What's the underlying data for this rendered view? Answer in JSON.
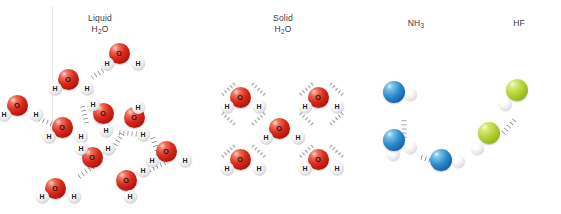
{
  "figure": {
    "title_visible": false,
    "background": "#ffffff",
    "width": 561,
    "height": 214,
    "divider": {
      "x": 52,
      "y": 6,
      "height": 132,
      "color": "#e9e6ea"
    }
  },
  "palette": {
    "oxygen": "#d92b1b",
    "hydrogen": "#f2f1f3",
    "nitrogen": "#2d8ccd",
    "fluorine": "#b5d334",
    "hydrogen_bond": "#8c8c8c",
    "label_text": "#3b3b3b",
    "atom_text": "#231f20"
  },
  "panels": [
    {
      "id": "liquid-water",
      "caption_line1": "Liquid",
      "caption_formula_base": "H",
      "caption_formula_sub": "2",
      "caption_formula_tail": "O",
      "caption_x": 100,
      "caption_y": 13,
      "molecule_label_o": "O",
      "molecule_label_h": "H",
      "molecules": [
        {
          "x": 17,
          "y": 105,
          "h1": {
            "dx": -13,
            "dy": 9,
            "label": "H"
          },
          "h2": {
            "dx": 19,
            "dy": 9,
            "label": "H"
          }
        },
        {
          "x": 62,
          "y": 127,
          "h1": {
            "dx": -13,
            "dy": 9,
            "label": "H"
          },
          "h2": {
            "dx": 19,
            "dy": 9,
            "label": "H"
          }
        },
        {
          "x": 68,
          "y": 79,
          "h1": {
            "dx": -13,
            "dy": 9,
            "label": "H"
          },
          "h2": {
            "dx": 19,
            "dy": 9,
            "label": "H"
          }
        },
        {
          "x": 119,
          "y": 53,
          "h1": {
            "dx": -12,
            "dy": 10,
            "label": "H"
          },
          "h2": {
            "dx": 19,
            "dy": 10,
            "label": "H"
          }
        },
        {
          "x": 103,
          "y": 113,
          "h1": {
            "dx": -10,
            "dy": -9,
            "label": "H"
          },
          "h2": {
            "dx": 3,
            "dy": 17,
            "label": "H"
          }
        },
        {
          "x": 134,
          "y": 117,
          "h1": {
            "dx": 4,
            "dy": -10,
            "label": "H"
          },
          "h2": {
            "dx": 9,
            "dy": 17,
            "label": "H"
          }
        },
        {
          "x": 92,
          "y": 157,
          "h1": {
            "dx": -11,
            "dy": -9,
            "label": "H"
          },
          "h2": {
            "dx": 16,
            "dy": -9,
            "label": "H"
          }
        },
        {
          "x": 55,
          "y": 188,
          "h1": {
            "dx": -13,
            "dy": 8,
            "label": "H"
          },
          "h2": {
            "dx": 19,
            "dy": 8,
            "label": "H"
          }
        },
        {
          "x": 126,
          "y": 180,
          "h1": {
            "dx": 17,
            "dy": -10,
            "label": "H"
          },
          "h2": {
            "dx": 4,
            "dy": 16,
            "label": "H"
          }
        },
        {
          "x": 166,
          "y": 151,
          "h1": {
            "dx": -14,
            "dy": 9,
            "label": "H"
          },
          "h2": {
            "dx": 19,
            "dy": 9,
            "label": "H"
          }
        }
      ],
      "bonds": [
        {
          "x": 38,
          "y": 118,
          "len": 20,
          "rot": 22
        },
        {
          "x": 82,
          "y": 104,
          "len": 21,
          "rot": 76
        },
        {
          "x": 92,
          "y": 77,
          "len": 25,
          "rot": -33
        },
        {
          "x": 118,
          "y": 132,
          "len": 20,
          "rot": 5
        },
        {
          "x": 112,
          "y": 150,
          "len": 22,
          "rot": -58
        },
        {
          "x": 78,
          "y": 177,
          "len": 20,
          "rot": -36
        },
        {
          "x": 152,
          "y": 136,
          "len": 20,
          "rot": 70
        },
        {
          "x": 148,
          "y": 170,
          "len": 20,
          "rot": -24
        }
      ]
    },
    {
      "id": "solid-water",
      "caption_line1": "Solid",
      "caption_formula_base": "H",
      "caption_formula_sub": "2",
      "caption_formula_tail": "O",
      "caption_x": 283,
      "caption_y": 13,
      "molecule_label_o": "O",
      "molecule_label_h": "H",
      "molecules": [
        {
          "x": 240,
          "y": 97,
          "h1": {
            "dx": -13,
            "dy": 9,
            "label": "H"
          },
          "h2": {
            "dx": 19,
            "dy": 9,
            "label": "H"
          }
        },
        {
          "x": 318,
          "y": 97,
          "h1": {
            "dx": -13,
            "dy": 9,
            "label": "H"
          },
          "h2": {
            "dx": 19,
            "dy": 9,
            "label": "H"
          }
        },
        {
          "x": 279,
          "y": 128,
          "h1": {
            "dx": -13,
            "dy": 9,
            "label": "H"
          },
          "h2": {
            "dx": 19,
            "dy": 9,
            "label": "H"
          }
        },
        {
          "x": 240,
          "y": 159,
          "h1": {
            "dx": -13,
            "dy": 9,
            "label": "H"
          },
          "h2": {
            "dx": 19,
            "dy": 9,
            "label": "H"
          }
        },
        {
          "x": 318,
          "y": 159,
          "h1": {
            "dx": -13,
            "dy": 9,
            "label": "H"
          },
          "h2": {
            "dx": 19,
            "dy": 9,
            "label": "H"
          }
        }
      ],
      "bonds": [
        {
          "x": 222,
          "y": 95,
          "len": 18,
          "rot": -42
        },
        {
          "x": 265,
          "y": 95,
          "len": 18,
          "rot": -138
        },
        {
          "x": 222,
          "y": 113,
          "len": 18,
          "rot": 42
        },
        {
          "x": 265,
          "y": 113,
          "len": 18,
          "rot": 138
        },
        {
          "x": 300,
          "y": 95,
          "len": 18,
          "rot": -42
        },
        {
          "x": 343,
          "y": 95,
          "len": 18,
          "rot": -138
        },
        {
          "x": 300,
          "y": 113,
          "len": 18,
          "rot": 42
        },
        {
          "x": 343,
          "y": 113,
          "len": 18,
          "rot": 138
        },
        {
          "x": 222,
          "y": 157,
          "len": 18,
          "rot": -42
        },
        {
          "x": 265,
          "y": 157,
          "len": 18,
          "rot": -138
        },
        {
          "x": 300,
          "y": 157,
          "len": 18,
          "rot": -42
        },
        {
          "x": 343,
          "y": 157,
          "len": 18,
          "rot": -138
        }
      ]
    },
    {
      "id": "ammonia",
      "caption_line1": "",
      "caption_formula_base": "NH",
      "caption_formula_sub": "3",
      "caption_formula_tail": "",
      "caption_x": 416,
      "caption_y": 18,
      "molecules": [
        {
          "x": 394,
          "y": 92,
          "h1": {
            "dx": 16,
            "dy": 2,
            "label": ""
          },
          "h2": {
            "dx": -3,
            "dy": -5,
            "label": ""
          }
        },
        {
          "x": 394,
          "y": 140,
          "h1": {
            "dx": 16,
            "dy": 7,
            "label": ""
          },
          "h2": {
            "dx": -1,
            "dy": 14,
            "label": ""
          }
        },
        {
          "x": 441,
          "y": 160,
          "h1": {
            "dx": 17,
            "dy": 1,
            "label": ""
          },
          "h2": {
            "dx": 1,
            "dy": -5,
            "label": ""
          }
        }
      ],
      "bonds": [
        {
          "x": 404,
          "y": 118,
          "len": 21,
          "rot": 90
        },
        {
          "x": 419,
          "y": 156,
          "len": 22,
          "rot": 18
        }
      ]
    },
    {
      "id": "hydrogen-fluoride",
      "caption_line1": "",
      "caption_formula_base": "HF",
      "caption_formula_sub": "",
      "caption_formula_tail": "",
      "caption_x": 519,
      "caption_y": 18,
      "molecules": [
        {
          "x": 517,
          "y": 90,
          "h1": {
            "dx": -12,
            "dy": 14,
            "label": ""
          },
          "h2": null
        },
        {
          "x": 489,
          "y": 133,
          "h1": {
            "dx": -12,
            "dy": 15,
            "label": ""
          },
          "h2": null
        }
      ],
      "bonds": [
        {
          "x": 502,
          "y": 134,
          "len": 21,
          "rot": -49
        }
      ]
    }
  ]
}
